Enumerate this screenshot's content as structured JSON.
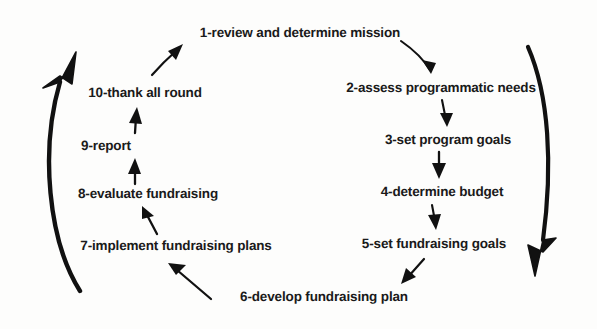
{
  "diagram": {
    "type": "cycle-flowchart",
    "stroke_color": "#111111",
    "text_color": "#1a1a1a",
    "background_color": "#fdfdfc",
    "nodes": [
      {
        "id": "step-1",
        "number": "1",
        "label": "1-review and determine mission",
        "x": 300,
        "y": 33
      },
      {
        "id": "step-2",
        "number": "2",
        "label": "2-assess programmatic needs",
        "x": 441,
        "y": 88
      },
      {
        "id": "step-3",
        "number": "3",
        "label": "3-set program goals",
        "x": 448,
        "y": 140
      },
      {
        "id": "step-4",
        "number": "4",
        "label": "4-determine budget",
        "x": 442,
        "y": 192
      },
      {
        "id": "step-5",
        "number": "5",
        "label": "5-set fundraising goals",
        "x": 434,
        "y": 244
      },
      {
        "id": "step-6",
        "number": "6",
        "label": "6-develop fundraising plan",
        "x": 324,
        "y": 297
      },
      {
        "id": "step-7",
        "number": "7",
        "label": "7-implement fundraising plans",
        "x": 176,
        "y": 246
      },
      {
        "id": "step-8",
        "number": "8",
        "label": "8-evaluate fundraising",
        "x": 148,
        "y": 194
      },
      {
        "id": "step-9",
        "number": "9",
        "label": "9-report",
        "x": 106,
        "y": 146
      },
      {
        "id": "step-10",
        "number": "10",
        "label": "10-thank all round",
        "x": 145,
        "y": 93
      }
    ],
    "connectors": [
      {
        "id": "arrow-1-to-2",
        "from": "step-1",
        "to": "step-2",
        "kind": "small-arrow"
      },
      {
        "id": "arrow-2-to-3",
        "from": "step-2",
        "to": "step-3",
        "kind": "small-arrow"
      },
      {
        "id": "arrow-3-to-4",
        "from": "step-3",
        "to": "step-4",
        "kind": "small-arrow"
      },
      {
        "id": "arrow-4-to-5",
        "from": "step-4",
        "to": "step-5",
        "kind": "small-arrow"
      },
      {
        "id": "arrow-5-to-6",
        "from": "step-5",
        "to": "step-6",
        "kind": "small-arrow"
      },
      {
        "id": "arrow-6-to-7",
        "from": "step-6",
        "to": "step-7",
        "kind": "small-arrow"
      },
      {
        "id": "arrow-7-to-8",
        "from": "step-7",
        "to": "step-8",
        "kind": "small-arrow"
      },
      {
        "id": "arrow-8-to-9",
        "from": "step-8",
        "to": "step-9",
        "kind": "small-arrow"
      },
      {
        "id": "arrow-9-to-10",
        "from": "step-9",
        "to": "step-10",
        "kind": "small-arrow"
      },
      {
        "id": "arc-right-descending",
        "from": "step-1",
        "to": "step-6",
        "kind": "large-arc",
        "direction": "down"
      },
      {
        "id": "arc-left-ascending",
        "from": "step-7",
        "to": "step-1",
        "kind": "large-arc",
        "direction": "up"
      }
    ]
  }
}
